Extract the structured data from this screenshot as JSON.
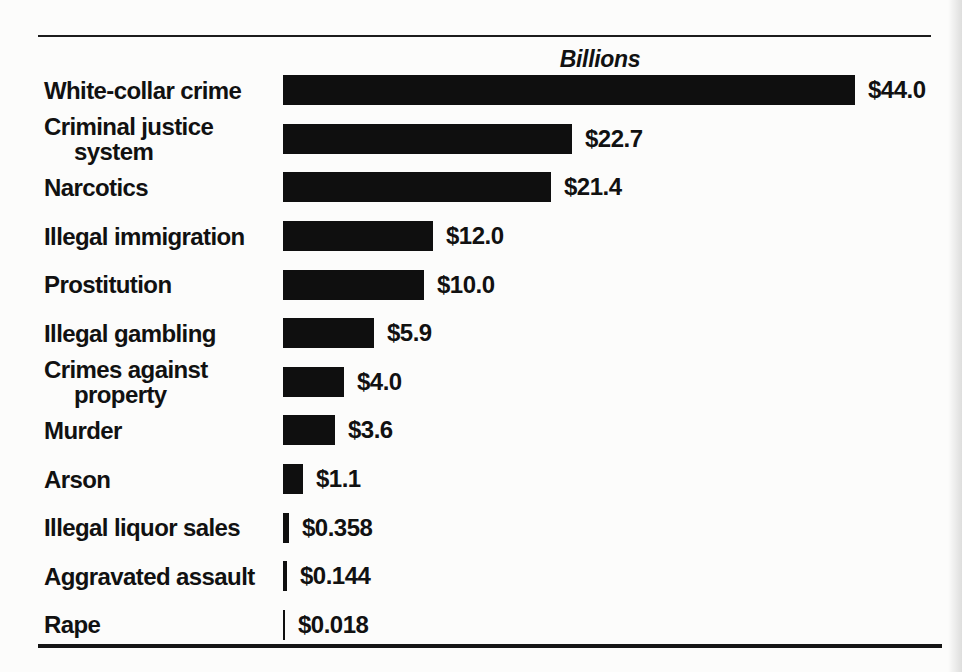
{
  "page": {
    "background_color": "#fcfcfb",
    "rule_color": "#1c1c1c"
  },
  "chart_data": {
    "type": "bar",
    "orientation": "horizontal",
    "title": "Billions",
    "title_style": "bold italic, centered over bar area",
    "xlabel": "",
    "ylabel": "",
    "xlim": [
      0,
      45
    ],
    "grid": false,
    "legend": "none",
    "bar_color": "#0f0f0f",
    "value_prefix": "$",
    "px_per_billion": 13,
    "categories": [
      "White-collar crime",
      "Criminal justice system",
      "Narcotics",
      "Illegal immigration",
      "Prostitution",
      "Illegal gambling",
      "Crimes against property",
      "Murder",
      "Arson",
      "Illegal liquor sales",
      "Aggravated assault",
      "Rape"
    ],
    "values": [
      44.0,
      22.7,
      21.4,
      12.0,
      10.0,
      5.9,
      4.0,
      3.6,
      1.1,
      0.358,
      0.144,
      0.018
    ],
    "rows": [
      {
        "label_lines": [
          "White-collar crime"
        ],
        "value": 44.0,
        "value_label": "$44.0",
        "bar_px": 572
      },
      {
        "label_lines": [
          "Criminal justice",
          "system"
        ],
        "value": 22.7,
        "value_label": "$22.7",
        "bar_px": 289
      },
      {
        "label_lines": [
          "Narcotics"
        ],
        "value": 21.4,
        "value_label": "$21.4",
        "bar_px": 268
      },
      {
        "label_lines": [
          "Illegal immigration"
        ],
        "value": 12.0,
        "value_label": "$12.0",
        "bar_px": 150
      },
      {
        "label_lines": [
          "Prostitution"
        ],
        "value": 10.0,
        "value_label": "$10.0",
        "bar_px": 141
      },
      {
        "label_lines": [
          "Illegal gambling"
        ],
        "value": 5.9,
        "value_label": "$5.9",
        "bar_px": 91
      },
      {
        "label_lines": [
          "Crimes against",
          "property"
        ],
        "value": 4.0,
        "value_label": "$4.0",
        "bar_px": 61
      },
      {
        "label_lines": [
          "Murder"
        ],
        "value": 3.6,
        "value_label": "$3.6",
        "bar_px": 52
      },
      {
        "label_lines": [
          "Arson"
        ],
        "value": 1.1,
        "value_label": "$1.1",
        "bar_px": 20
      },
      {
        "label_lines": [
          "Illegal liquor sales"
        ],
        "value": 0.358,
        "value_label": "$0.358",
        "bar_px": 6
      },
      {
        "label_lines": [
          "Aggravated assault"
        ],
        "value": 0.144,
        "value_label": "$0.144",
        "bar_px": 4
      },
      {
        "label_lines": [
          "Rape"
        ],
        "value": 0.018,
        "value_label": "$0.018",
        "bar_px": 2
      }
    ]
  }
}
